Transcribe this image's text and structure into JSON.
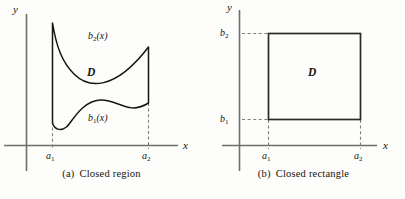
{
  "figure": {
    "panels": [
      {
        "id": "closed-region",
        "caption_tag": "(a)",
        "caption_text": "Closed region",
        "axis_x_label": "x",
        "axis_y_label": "y",
        "region_label": "D",
        "upper_curve_label": "b",
        "upper_curve_sub": "2",
        "upper_curve_arg": "(x)",
        "lower_curve_label": "b",
        "lower_curve_sub": "1",
        "lower_curve_arg": "(x)",
        "tick_left_label": "a",
        "tick_left_sub": "1",
        "tick_right_label": "a",
        "tick_right_sub": "2"
      },
      {
        "id": "closed-rectangle",
        "caption_tag": "(b)",
        "caption_text": "Closed rectangle",
        "axis_x_label": "x",
        "axis_y_label": "y",
        "region_label": "D",
        "tick_left_label": "a",
        "tick_left_sub": "1",
        "tick_right_label": "a",
        "tick_right_sub": "2",
        "tick_bottom_label": "b",
        "tick_bottom_sub": "1",
        "tick_top_label": "b",
        "tick_top_sub": "2"
      }
    ],
    "colors": {
      "ink": "#16140f",
      "axis": "#6b6b66",
      "curve": "#161410",
      "dash": "#7a7a75",
      "background": "#fdfdfc"
    }
  }
}
